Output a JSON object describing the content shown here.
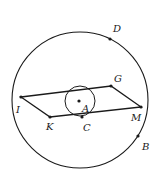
{
  "diagram": {
    "type": "geometry",
    "stroke_color": "#1a1a1a",
    "background": "#ffffff",
    "large_circle": {
      "center": "A",
      "cx": 80,
      "cy": 100,
      "r": 68
    },
    "small_circle": {
      "center": "A",
      "cx": 80,
      "cy": 101,
      "r": 15
    },
    "parallelogram": {
      "vertices": [
        "I",
        "G",
        "M",
        "K"
      ]
    },
    "points": [
      {
        "name": "D",
        "label": "D",
        "x": 110,
        "y": 39,
        "lx": 113,
        "ly": 32
      },
      {
        "name": "G",
        "label": "G",
        "x": 111,
        "y": 86,
        "lx": 114,
        "ly": 82
      },
      {
        "name": "I",
        "label": "I",
        "x": 21,
        "y": 97,
        "lx": 16,
        "ly": 113
      },
      {
        "name": "A",
        "label": "A",
        "x": 79,
        "y": 101,
        "lx": 82,
        "ly": 112
      },
      {
        "name": "M",
        "label": "M",
        "x": 141,
        "y": 107,
        "lx": 131,
        "ly": 121
      },
      {
        "name": "K",
        "label": "K",
        "x": 50,
        "y": 117,
        "lx": 46,
        "ly": 130
      },
      {
        "name": "C",
        "label": "C",
        "x": 82,
        "y": 117,
        "lx": 83,
        "ly": 131
      },
      {
        "name": "B",
        "label": "B",
        "x": 138,
        "y": 136,
        "lx": 142,
        "ly": 150
      }
    ]
  }
}
